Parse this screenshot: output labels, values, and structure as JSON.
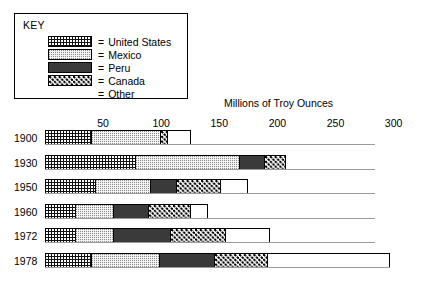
{
  "key": {
    "title": "KEY",
    "rows": [
      {
        "swatch": "us-swatch",
        "eq": "=",
        "label": "United States"
      },
      {
        "swatch": "mexico-swatch",
        "eq": "=",
        "label": "Mexico"
      },
      {
        "swatch": "peru-swatch",
        "eq": "=",
        "label": "Peru"
      },
      {
        "swatch": "canada-swatch",
        "eq": "=",
        "label": "Canada"
      },
      {
        "swatch": "other-swatch",
        "eq": "=",
        "label": "Other"
      }
    ]
  },
  "axis_title": "Millions of Troy Ounces",
  "tick_labels": [
    "50",
    "100",
    "150",
    "200",
    "250",
    "300"
  ],
  "chart_data": {
    "type": "bar",
    "orientation": "horizontal",
    "stacked": true,
    "title": "",
    "xlabel": "Millions of Troy Ounces",
    "ylabel": "",
    "xlim": [
      0,
      300
    ],
    "xticks": [
      50,
      100,
      150,
      200,
      250,
      300
    ],
    "grid": false,
    "legend": "top-left KEY box",
    "categories": [
      "1900",
      "1930",
      "1950",
      "1960",
      "1972",
      "1978"
    ],
    "series": [
      {
        "name": "United States",
        "pattern": "black-with-white-dots",
        "values": [
          40,
          78,
          43,
          26,
          26,
          40
        ]
      },
      {
        "name": "Mexico",
        "pattern": "light-stipple",
        "values": [
          60,
          90,
          48,
          33,
          33,
          58
        ]
      },
      {
        "name": "Peru",
        "pattern": "solid-dark",
        "values": [
          0,
          21,
          22,
          30,
          49,
          48
        ]
      },
      {
        "name": "Canada",
        "pattern": "white-with-black-dots",
        "values": [
          6,
          18,
          38,
          37,
          48,
          46
        ]
      },
      {
        "name": "Other",
        "pattern": "plain-white",
        "values": [
          20,
          0,
          24,
          14,
          38,
          105
        ]
      }
    ],
    "totals": [
      126,
      207,
      175,
      140,
      194,
      297
    ]
  }
}
